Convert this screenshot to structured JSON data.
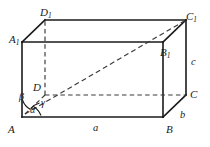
{
  "figure": {
    "type": "geometry-diagram",
    "shape": "rectangular-cuboid",
    "width": 210,
    "height": 147,
    "background_color": "#ffffff",
    "line_color": "#1a1a1a",
    "hidden_line_color": "#3a3a3a",
    "label_color": "#1a1a1a"
  },
  "vertices": {
    "A": {
      "label": "A",
      "sub": "",
      "x": 22,
      "y": 117
    },
    "B": {
      "label": "B",
      "sub": "",
      "x": 163,
      "y": 117
    },
    "C": {
      "label": "C",
      "sub": "",
      "x": 186,
      "y": 95
    },
    "D": {
      "label": "D",
      "sub": "",
      "x": 45,
      "y": 95
    },
    "A1": {
      "label": "A",
      "sub": "1",
      "x": 22,
      "y": 42
    },
    "B1": {
      "label": "B",
      "sub": "1",
      "x": 163,
      "y": 42
    },
    "C1": {
      "label": "C",
      "sub": "1",
      "x": 186,
      "y": 20
    },
    "D1": {
      "label": "D",
      "sub": "1",
      "x": 45,
      "y": 20
    }
  },
  "edge_labels": {
    "a": {
      "text": "a",
      "describes": "AB-bottom-front-edge"
    },
    "b": {
      "text": "b",
      "describes": "BC-bottom-right-depth-edge"
    },
    "c": {
      "text": "c",
      "describes": "CC1-vertical-edge"
    }
  },
  "angle_labels": {
    "alpha": {
      "text": "α",
      "describes": "angle-between-diagonal-and-AB"
    },
    "beta": {
      "text": "β",
      "describes": "angle-between-diagonal-and-AA1"
    },
    "gamma": {
      "text": "γ",
      "describes": "angle-between-diagonal-and-AD"
    }
  },
  "diagonal": {
    "from": "A",
    "to": "C1",
    "style": "dashed",
    "describes": "space-diagonal"
  },
  "hidden_edges": [
    {
      "from": "D",
      "to": "C",
      "style": "dashed"
    },
    {
      "from": "D",
      "to": "D1",
      "style": "dashed"
    },
    {
      "from": "D",
      "to": "A",
      "style": "dashed"
    }
  ]
}
